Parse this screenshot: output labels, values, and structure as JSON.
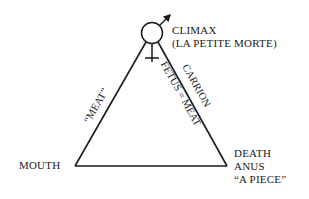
{
  "diagram": {
    "top": {
      "line1": "CLIMAX",
      "line2": "(LA PETITE MORTE)",
      "symbol": "venus-mars-symbol"
    },
    "left_vertex": {
      "label": "MOUTH"
    },
    "right_vertex": {
      "line1": "DEATH",
      "line2": "ANUS",
      "line3": "“A PIECE”"
    },
    "left_edge": {
      "label": "“MEAT”"
    },
    "right_edge": {
      "outer_label": "CARRION",
      "inner_label": "FETUS = MEAT"
    },
    "colors": {
      "ink": "#1a1a1a",
      "background": "#ffffff"
    }
  }
}
